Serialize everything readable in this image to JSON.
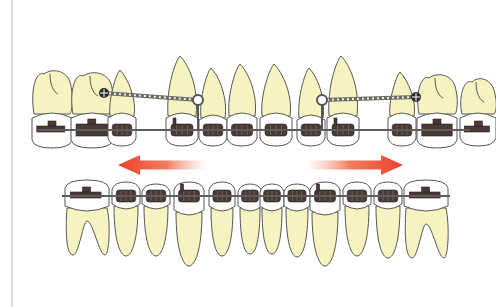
{
  "figure": {
    "left_border_x": 12,
    "colors": {
      "root": "#f6f3c0",
      "crown": "#ffffff",
      "outline": "#555555",
      "bracket": "#4a3a36",
      "archwire": "#5c5c5c",
      "arrow": "#e8402a"
    }
  },
  "upper_arch": {
    "wire_y": 130,
    "teeth": [
      {
        "type": "molar",
        "x": 52,
        "w": 40,
        "root_top": 70,
        "crown_top": 112,
        "crown_bot": 148,
        "bracket": "tube"
      },
      {
        "type": "molar",
        "x": 92,
        "w": 42,
        "root_top": 72,
        "crown_top": 112,
        "crown_bot": 148,
        "bracket": "double-tube"
      },
      {
        "type": "premolar",
        "x": 122,
        "w": 28,
        "root_top": 70,
        "crown_top": 112,
        "crown_bot": 146,
        "bracket": "standard"
      },
      {
        "type": "canine",
        "x": 182,
        "w": 32,
        "root_top": 56,
        "crown_top": 112,
        "crown_bot": 146,
        "bracket": "hook"
      },
      {
        "type": "lateral",
        "x": 213,
        "w": 28,
        "root_top": 68,
        "crown_top": 114,
        "crown_bot": 146,
        "bracket": "standard"
      },
      {
        "type": "central",
        "x": 242,
        "w": 30,
        "root_top": 64,
        "crown_top": 112,
        "crown_bot": 146,
        "bracket": "standard"
      },
      {
        "type": "central",
        "x": 276,
        "w": 32,
        "root_top": 64,
        "crown_top": 112,
        "crown_bot": 146,
        "bracket": "standard"
      },
      {
        "type": "lateral",
        "x": 311,
        "w": 28,
        "root_top": 68,
        "crown_top": 114,
        "crown_bot": 146,
        "bracket": "standard"
      },
      {
        "type": "canine",
        "x": 343,
        "w": 32,
        "root_top": 56,
        "crown_top": 112,
        "crown_bot": 146,
        "bracket": "hook"
      },
      {
        "type": "premolar",
        "x": 402,
        "w": 28,
        "root_top": 72,
        "crown_top": 112,
        "crown_bot": 146,
        "bracket": "standard"
      },
      {
        "type": "molar",
        "x": 437,
        "w": 40,
        "root_top": 74,
        "crown_top": 112,
        "crown_bot": 148,
        "bracket": "double-tube"
      },
      {
        "type": "molar",
        "x": 478,
        "w": 36,
        "root_top": 78,
        "crown_top": 112,
        "crown_bot": 146,
        "bracket": "tube"
      }
    ],
    "springs": [
      {
        "from": [
          104,
          93
        ],
        "to": [
          198,
          100
        ],
        "stop_end": "left"
      },
      {
        "from": [
          322,
          100
        ],
        "to": [
          416,
          97
        ],
        "stop_end": "right"
      }
    ]
  },
  "arrows": [
    {
      "direction": "left",
      "x1": 208,
      "x2": 118,
      "y": 165,
      "label": "distal force"
    },
    {
      "direction": "right",
      "x1": 305,
      "x2": 403,
      "y": 165,
      "label": "distal force"
    }
  ],
  "lower_arch": {
    "wire_y": 196,
    "teeth": [
      {
        "type": "molar",
        "x": 87,
        "w": 44,
        "crown_top": 180,
        "crown_bot": 212,
        "root_bot": 255,
        "bracket": "tube"
      },
      {
        "type": "premolar",
        "x": 126,
        "w": 28,
        "crown_top": 182,
        "crown_bot": 210,
        "root_bot": 256,
        "bracket": "standard"
      },
      {
        "type": "premolar",
        "x": 156,
        "w": 28,
        "crown_top": 184,
        "crown_bot": 210,
        "root_bot": 256,
        "bracket": "standard"
      },
      {
        "type": "canine",
        "x": 189,
        "w": 30,
        "crown_top": 182,
        "crown_bot": 216,
        "root_bot": 266,
        "bracket": "hook"
      },
      {
        "type": "lateral",
        "x": 222,
        "w": 26,
        "crown_top": 182,
        "crown_bot": 212,
        "root_bot": 256,
        "bracket": "standard"
      },
      {
        "type": "central",
        "x": 250,
        "w": 24,
        "crown_top": 184,
        "crown_bot": 212,
        "root_bot": 254,
        "bracket": "standard"
      },
      {
        "type": "central",
        "x": 272,
        "w": 24,
        "crown_top": 184,
        "crown_bot": 212,
        "root_bot": 254,
        "bracket": "standard"
      },
      {
        "type": "lateral",
        "x": 297,
        "w": 26,
        "crown_top": 184,
        "crown_bot": 212,
        "root_bot": 257,
        "bracket": "standard"
      },
      {
        "type": "canine",
        "x": 325,
        "w": 30,
        "crown_top": 182,
        "crown_bot": 216,
        "root_bot": 266,
        "bracket": "hook"
      },
      {
        "type": "premolar",
        "x": 357,
        "w": 28,
        "crown_top": 182,
        "crown_bot": 210,
        "root_bot": 256,
        "bracket": "standard"
      },
      {
        "type": "premolar",
        "x": 388,
        "w": 28,
        "crown_top": 182,
        "crown_bot": 210,
        "root_bot": 258,
        "bracket": "standard"
      },
      {
        "type": "molar",
        "x": 426,
        "w": 44,
        "crown_top": 180,
        "crown_bot": 212,
        "root_bot": 258,
        "bracket": "tube"
      }
    ]
  }
}
